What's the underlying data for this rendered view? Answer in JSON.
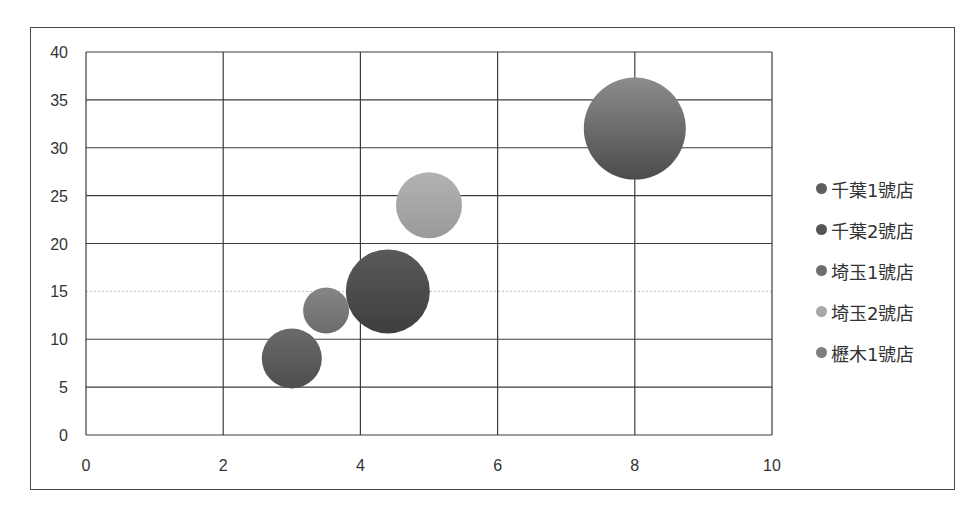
{
  "chart_data": {
    "type": "bubble",
    "title": "",
    "xlabel": "",
    "ylabel": "",
    "xlim": [
      0,
      10
    ],
    "ylim": [
      0,
      40
    ],
    "xticks": [
      0,
      2,
      4,
      6,
      8,
      10
    ],
    "yticks": [
      0,
      5,
      10,
      15,
      20,
      25,
      30,
      35,
      40
    ],
    "grid": true,
    "legend_position": "right",
    "series": [
      {
        "name": "千葉1號店",
        "x": 3.0,
        "y": 8,
        "size": 30,
        "color": "#5e5e5e"
      },
      {
        "name": "千葉2號店",
        "x": 4.4,
        "y": 15,
        "size": 42,
        "color": "#4f4f4f"
      },
      {
        "name": "埼玉1號店",
        "x": 8.0,
        "y": 32,
        "size": 51,
        "color": "#707070"
      },
      {
        "name": "埼玉2號店",
        "x": 5.0,
        "y": 24,
        "size": 33,
        "color": "#a6a6a6"
      },
      {
        "name": "櫪木1號店",
        "x": 3.5,
        "y": 13,
        "size": 23,
        "color": "#7a7a7a"
      }
    ]
  },
  "legend": {
    "items": [
      {
        "label": "千葉1號店",
        "color": "#5e5e5e"
      },
      {
        "label": "千葉2號店",
        "color": "#555555"
      },
      {
        "label": "埼玉1號店",
        "color": "#6e6e6e"
      },
      {
        "label": "埼玉2號店",
        "color": "#a8a8a8"
      },
      {
        "label": "櫪木1號店",
        "color": "#7e7e7e"
      }
    ]
  }
}
